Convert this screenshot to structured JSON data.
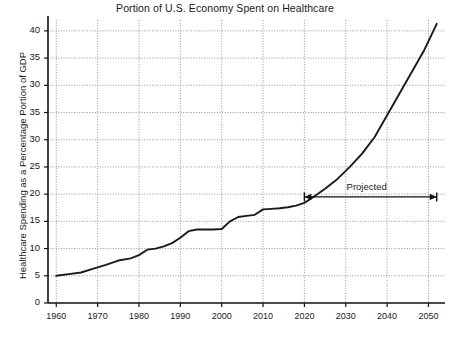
{
  "chart_data": {
    "type": "line",
    "title": "Portion of U.S. Economy Spent on Healthcare",
    "xlabel": "",
    "ylabel": "Healthcare Spending as a Percentage Portion of GDP",
    "xlim": [
      1958,
      2054
    ],
    "ylim": [
      0,
      52
    ],
    "grid": true,
    "legend": null,
    "x_ticks": [
      "1960",
      "1970",
      "1980",
      "1990",
      "2000",
      "2010",
      "2020",
      "2030",
      "2040",
      "2050"
    ],
    "x_tick_values": [
      1960,
      1970,
      1980,
      1990,
      2000,
      2010,
      2020,
      2030,
      2040,
      2050
    ],
    "y_ticks": [
      "0",
      "5",
      "10",
      "15",
      "20",
      "25",
      "30",
      "35",
      "30",
      "35",
      "40",
      "45",
      "50"
    ],
    "y_tick_values": [
      0,
      5,
      10,
      15,
      20,
      25,
      30,
      35,
      40,
      45,
      50,
      55,
      60
    ],
    "annotations": [
      {
        "text": "Projected",
        "type": "double-arrow-span",
        "x_start": 2020,
        "x_end": 2052,
        "y": 19.5
      }
    ],
    "series": [
      {
        "name": "Healthcare Spending as % of GDP",
        "color": "#1a1a1a",
        "x": [
          1960,
          1963,
          1966,
          1969,
          1972,
          1975,
          1978,
          1980,
          1982,
          1984,
          1986,
          1988,
          1990,
          1992,
          1994,
          1996,
          1998,
          2000,
          2002,
          2004,
          2006,
          2008,
          2010,
          2012,
          2014,
          2016,
          2018,
          2020,
          2022,
          2025,
          2028,
          2031,
          2034,
          2037,
          2040,
          2043,
          2046,
          2049,
          2052
        ],
        "y": [
          5.0,
          5.3,
          5.6,
          6.3,
          7.0,
          7.8,
          8.2,
          8.8,
          9.8,
          10.0,
          10.4,
          11.0,
          12.0,
          13.2,
          13.5,
          13.5,
          13.5,
          13.6,
          15.0,
          15.8,
          16.0,
          16.2,
          17.2,
          17.3,
          17.4,
          17.6,
          17.9,
          18.4,
          19.4,
          21.0,
          22.8,
          25.0,
          27.5,
          30.5,
          34.5,
          38.5,
          42.5,
          46.5,
          51.3
        ]
      }
    ]
  },
  "plot_geometry": {
    "left": 48,
    "right": 445,
    "top": 20,
    "bottom": 303
  }
}
